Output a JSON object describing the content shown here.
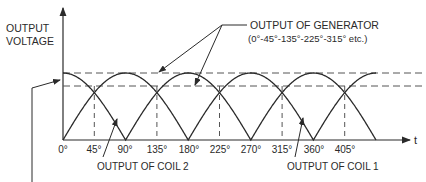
{
  "figure": {
    "y_axis_label_line1": "OUTPUT",
    "y_axis_label_line2": "VOLTAGE",
    "x_axis_label": "t",
    "generator_label_line1": "OUTPUT OF GENERATOR",
    "generator_label_line2": "(0°-45°-135°-225°-315° etc.)",
    "coil2_label": "OUTPUT OF COIL 2",
    "coil1_label": "OUTPUT OF COIL 1",
    "ticks": [
      "0°",
      "45°",
      "90°",
      "135°",
      "180°",
      "225°",
      "270°",
      "315°",
      "360°",
      "405°"
    ],
    "colors": {
      "line": "#2a2a2a",
      "dashed": "#555555",
      "background": "#ffffff"
    }
  },
  "chart_data": {
    "type": "line",
    "xlabel": "t",
    "ylabel": "OUTPUT VOLTAGE",
    "x_ticks_deg": [
      0,
      45,
      90,
      135,
      180,
      225,
      270,
      315,
      360,
      405
    ],
    "series": [
      {
        "name": "OUTPUT OF COIL 1",
        "shape": "|cos(t)|",
        "zeros_deg": [
          90,
          270,
          450
        ],
        "peaks_deg": [
          0,
          180,
          360
        ]
      },
      {
        "name": "OUTPUT OF COIL 2",
        "shape": "|sin(t)|",
        "zeros_deg": [
          0,
          180,
          360
        ],
        "peaks_deg": [
          90,
          270,
          450
        ]
      }
    ],
    "reference_lines": [
      {
        "name": "peak",
        "value": 1.0,
        "style": "dashed"
      },
      {
        "name": "generator output minimum (crossing)",
        "value": 0.707,
        "style": "dashed"
      }
    ],
    "crossing_points_deg": [
      45,
      135,
      225,
      315,
      405
    ],
    "annotations": [
      "OUTPUT OF GENERATOR (0°-45°-135°-225°-315° etc.)",
      "OUTPUT OF COIL 2",
      "OUTPUT OF COIL 1"
    ],
    "grid": false
  }
}
